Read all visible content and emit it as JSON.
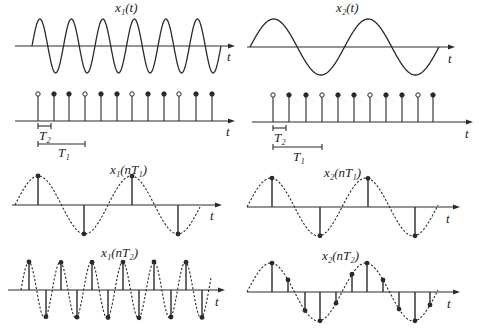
{
  "colors": {
    "stroke": "#2a2a2a",
    "background": "#ffffff"
  },
  "panels": {
    "x1_t": {
      "label": "x₁(t)",
      "axis_label": "t",
      "axis": {
        "x0": 15,
        "x1": 235,
        "y": 46
      },
      "wave": {
        "start": 32,
        "end": 221,
        "amp": 27,
        "period": 31.5,
        "phase": 0,
        "dashed": false
      }
    },
    "x2_t": {
      "label": "x₂(t)",
      "axis_label": "t",
      "axis": {
        "x0": 247,
        "x1": 455,
        "y": 47
      },
      "wave": {
        "start": 250,
        "end": 439,
        "amp": 28,
        "period": 94.5,
        "phase": 0,
        "dashed": false
      }
    },
    "samp_left": {
      "axis_label": "t",
      "axis": {
        "x0": 15,
        "x1": 235,
        "y": 121
      },
      "stem_top": 94,
      "stems": [
        38,
        54,
        69,
        85,
        101,
        117,
        132,
        148,
        164,
        179,
        196,
        212
      ],
      "open_indices": [
        0,
        3,
        6,
        9
      ],
      "T2": {
        "label": "T₂",
        "x0": 38,
        "x1": 51,
        "y": 126
      },
      "T1": {
        "label": "T₁",
        "x0": 38,
        "x1": 85,
        "y": 144
      }
    },
    "samp_right": {
      "axis_label": "t",
      "axis": {
        "x0": 252,
        "x1": 473,
        "y": 122
      },
      "stem_top": 95,
      "stems": [
        273,
        289,
        306,
        322,
        338,
        354,
        370,
        386,
        402,
        418,
        433
      ],
      "open_indices": [
        0,
        3,
        6,
        9
      ],
      "T2": {
        "label": "T₂",
        "x0": 273,
        "x1": 286,
        "y": 128
      },
      "T1": {
        "label": "T₁",
        "x0": 273,
        "x1": 322,
        "y": 147
      }
    },
    "x1_nT1": {
      "label": "x₁(nT₁)",
      "axis_label": "t",
      "axis": {
        "x0": 12,
        "x1": 222,
        "y": 205
      },
      "wave": {
        "start": 15,
        "end": 200,
        "amp": 29,
        "period": 93,
        "phase": 0,
        "dashed": true
      },
      "samples": [
        38,
        84,
        132,
        178
      ]
    },
    "x2_nT1": {
      "label": "x₂(nT₁)",
      "axis_label": "t",
      "axis": {
        "x0": 247,
        "x1": 460,
        "y": 207
      },
      "wave": {
        "start": 247,
        "end": 438,
        "amp": 29,
        "period": 95,
        "phase": 0,
        "dashed": true
      },
      "samples": [
        272,
        320,
        368,
        415
      ]
    },
    "x1_nT2": {
      "label": "x₁(nT₂)",
      "axis_label": "t",
      "axis": {
        "x0": 8,
        "x1": 225,
        "y": 290
      },
      "wave": {
        "start": 21,
        "end": 211,
        "amp": 28,
        "period": 31.3,
        "phase": 0,
        "dashed": true
      },
      "samples": [
        29,
        46,
        61,
        77,
        92,
        108,
        123,
        139,
        154,
        171,
        186,
        202
      ]
    },
    "x2_nT2": {
      "label": "x₂(nT₂)",
      "axis_label": "t",
      "axis": {
        "x0": 247,
        "x1": 460,
        "y": 292
      },
      "wave": {
        "start": 247,
        "end": 438,
        "amp": 29,
        "period": 95,
        "phase": 0,
        "dashed": true
      },
      "samples": [
        272,
        288,
        305,
        320,
        336,
        352,
        367,
        383,
        399,
        415,
        430
      ]
    }
  },
  "labels": {
    "x1_t": "x₁(t)",
    "x2_t": "x₂(t)",
    "x1_nT1": "x₁(nT₁)",
    "x2_nT1": "x₂(nT₁)",
    "x1_nT2": "x₁(nT₂)",
    "x2_nT2": "x₂(nT₂)",
    "T1": "T₁",
    "T2": "T₂",
    "t": "t"
  }
}
